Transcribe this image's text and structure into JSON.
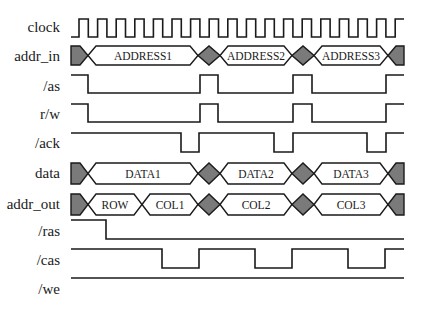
{
  "diagram": {
    "type": "timing-diagram",
    "colors": {
      "line": "#1a1a1a",
      "undefined_fill": "#7a7a7a",
      "bus_fill": "#ffffff",
      "background": "#ffffff"
    },
    "x_start": 71,
    "x_end": 404,
    "signals": [
      {
        "id": "clock",
        "label": "clock",
        "kind": "clock",
        "label_y": 32,
        "high_y": 19,
        "low_y": 37,
        "first_rise": 79,
        "period": 18.6,
        "pulses": 18
      },
      {
        "id": "addr_in",
        "label": "addr_in",
        "kind": "bus",
        "label_y": 61,
        "top": 46,
        "bottom": 65,
        "segments": [
          {
            "type": "undef",
            "from": 71,
            "to": 88
          },
          {
            "type": "value",
            "from": 88,
            "to": 198,
            "text": "ADDRESS1"
          },
          {
            "type": "undef",
            "from": 198,
            "to": 220
          },
          {
            "type": "value",
            "from": 220,
            "to": 292,
            "text": "ADDRESS2"
          },
          {
            "type": "undef",
            "from": 292,
            "to": 314
          },
          {
            "type": "value",
            "from": 314,
            "to": 388,
            "text": "ADDRESS3"
          },
          {
            "type": "undef",
            "from": 388,
            "to": 404
          }
        ]
      },
      {
        "id": "as",
        "label": "/as",
        "kind": "logic",
        "label_y": 91,
        "high_y": 75,
        "low_y": 93,
        "edges": [
          [
            71,
            1
          ],
          [
            88,
            0
          ],
          [
            200,
            1
          ],
          [
            218,
            0
          ],
          [
            293,
            1
          ],
          [
            312,
            0
          ],
          [
            386,
            1
          ],
          [
            404,
            1
          ]
        ]
      },
      {
        "id": "rw",
        "label": "r/w",
        "kind": "logic",
        "label_y": 119,
        "high_y": 104,
        "low_y": 122,
        "edges": [
          [
            71,
            1
          ],
          [
            88,
            0
          ],
          [
            200,
            1
          ],
          [
            218,
            0
          ],
          [
            293,
            1
          ],
          [
            312,
            0
          ],
          [
            386,
            1
          ],
          [
            404,
            1
          ]
        ]
      },
      {
        "id": "ack",
        "label": "/ack",
        "kind": "logic",
        "label_y": 148,
        "high_y": 133,
        "low_y": 152,
        "edges": [
          [
            71,
            1
          ],
          [
            181,
            0
          ],
          [
            199,
            1
          ],
          [
            274,
            0
          ],
          [
            293,
            1
          ],
          [
            367,
            0
          ],
          [
            386,
            1
          ],
          [
            404,
            1
          ]
        ]
      },
      {
        "id": "data",
        "label": "data",
        "kind": "bus",
        "label_y": 178,
        "top": 163,
        "bottom": 184,
        "segments": [
          {
            "type": "undef",
            "from": 71,
            "to": 88
          },
          {
            "type": "value",
            "from": 88,
            "to": 198,
            "text": "DATA1"
          },
          {
            "type": "undef",
            "from": 198,
            "to": 220
          },
          {
            "type": "value",
            "from": 220,
            "to": 292,
            "text": "DATA2"
          },
          {
            "type": "undef",
            "from": 292,
            "to": 314
          },
          {
            "type": "value",
            "from": 314,
            "to": 388,
            "text": "DATA3"
          },
          {
            "type": "undef",
            "from": 388,
            "to": 404
          }
        ]
      },
      {
        "id": "addr_out",
        "label": "addr_out",
        "kind": "bus",
        "label_y": 209,
        "top": 194,
        "bottom": 215,
        "segments": [
          {
            "type": "undef",
            "from": 71,
            "to": 88
          },
          {
            "type": "value",
            "from": 88,
            "to": 142,
            "text": "ROW"
          },
          {
            "type": "value",
            "from": 142,
            "to": 198,
            "text": "COL1"
          },
          {
            "type": "undef",
            "from": 198,
            "to": 220
          },
          {
            "type": "value",
            "from": 220,
            "to": 292,
            "text": "COL2"
          },
          {
            "type": "undef",
            "from": 292,
            "to": 314
          },
          {
            "type": "value",
            "from": 314,
            "to": 388,
            "text": "COL3"
          },
          {
            "type": "undef",
            "from": 388,
            "to": 404
          }
        ]
      },
      {
        "id": "ras",
        "label": "/ras",
        "kind": "logic",
        "label_y": 236,
        "high_y": 220,
        "low_y": 239,
        "edges": [
          [
            71,
            1
          ],
          [
            106,
            0
          ],
          [
            404,
            0
          ]
        ]
      },
      {
        "id": "cas",
        "label": "/cas",
        "kind": "logic",
        "label_y": 265,
        "high_y": 249,
        "low_y": 268,
        "edges": [
          [
            71,
            1
          ],
          [
            162,
            0
          ],
          [
            199,
            1
          ],
          [
            255,
            0
          ],
          [
            292,
            1
          ],
          [
            348,
            0
          ],
          [
            385,
            1
          ],
          [
            404,
            1
          ]
        ]
      },
      {
        "id": "we",
        "label": "/we",
        "kind": "logic",
        "label_y": 294,
        "high_y": 278,
        "low_y": 297,
        "edges": [
          [
            71,
            1
          ],
          [
            404,
            1
          ]
        ]
      }
    ]
  }
}
